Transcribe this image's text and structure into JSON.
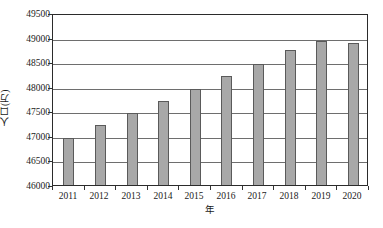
{
  "chart_data": {
    "type": "bar",
    "title": "",
    "xlabel": "年",
    "ylabel": "人口(万)",
    "categories": [
      "2011",
      "2012",
      "2013",
      "2014",
      "2015",
      "2016",
      "2017",
      "2018",
      "2019",
      "2020"
    ],
    "values": [
      47000,
      47270,
      47500,
      47750,
      48000,
      48250,
      48510,
      48790,
      48970,
      48940
    ],
    "series": [
      {
        "name": "人口(万)",
        "values": [
          47000,
          47270,
          47500,
          47750,
          48000,
          48250,
          48510,
          48790,
          48970,
          48940
        ]
      }
    ],
    "ylim": [
      46000,
      49500
    ],
    "ytick_step": 500,
    "ytick_labels": [
      "46000",
      "46500",
      "47000",
      "47500",
      "48000",
      "48500",
      "49000",
      "49500"
    ],
    "ytick_values": [
      46000,
      46500,
      47000,
      47500,
      48000,
      48500,
      49000,
      49500
    ],
    "grid": true,
    "grid_axis": "y",
    "legend": false,
    "legend_position": "none",
    "bar_fill_color": "#a8a8a8",
    "bar_border_color": "#5a5a5a",
    "gridline_color": "#6e6e6e",
    "frame_color": "#2b2b2b",
    "background_color": "#ffffff"
  }
}
